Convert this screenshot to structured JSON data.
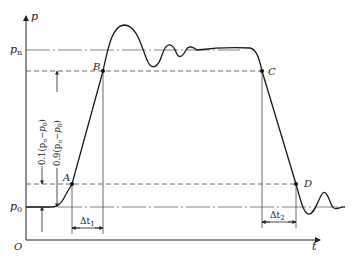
{
  "diagram": {
    "type": "pressure-time waveform",
    "axes": {
      "y_label": "p",
      "x_label": "t",
      "origin_label": "O"
    },
    "levels": {
      "p_n": "p",
      "p_n_sub": "n",
      "p_0": "p",
      "p_0_sub": "0"
    },
    "points": {
      "A": "A",
      "B": "B",
      "C": "C",
      "D": "D"
    },
    "intervals": {
      "dt1": "Δt",
      "dt1_sub": "1",
      "dt2": "Δt",
      "dt2_sub": "2"
    },
    "annotations": {
      "low_fraction": "0.1(p",
      "low_fraction_n": "n",
      "low_fraction_mid": "−p",
      "low_fraction_0": "0",
      "low_fraction_end": ")",
      "high_fraction": "0.9(p",
      "high_fraction_n": "n",
      "high_fraction_mid": "−p",
      "high_fraction_0": "0",
      "high_fraction_end": ")"
    },
    "colors": {
      "curve": "#1a1a1a",
      "reference_lines": "#555555",
      "axes": "#222222"
    }
  }
}
